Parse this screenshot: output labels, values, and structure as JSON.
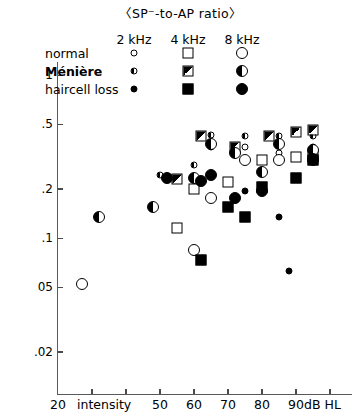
{
  "title": "〈SP⁻-to-AP ratio〉",
  "legend": {
    "position": "top-center-inside",
    "columns": [
      {
        "key": "f2",
        "label": "2 kHz"
      },
      {
        "key": "f4",
        "label": "4 kHz"
      },
      {
        "key": "f8",
        "label": "8 kHz"
      }
    ],
    "rows": [
      {
        "key": "normal",
        "label": "normal",
        "bold": false
      },
      {
        "key": "meniere",
        "label": "Ménière",
        "bold": true
      },
      {
        "key": "haircell",
        "label": "haircell loss",
        "bold": false
      }
    ]
  },
  "axes": {
    "x": {
      "caption": "intensity",
      "unit": "dB HL",
      "min": 20,
      "max": 100,
      "ticks": [
        20,
        30,
        40,
        50,
        60,
        70,
        80,
        90,
        100
      ],
      "tick_labels": [
        "20",
        "",
        "",
        "50",
        "60",
        "70",
        "80",
        "90",
        ""
      ],
      "scale": "linear"
    },
    "y": {
      "label": "",
      "scale": "log",
      "min": 0.018,
      "max": 1.35,
      "ticks": [
        1,
        0.5,
        0.2,
        0.1,
        0.05,
        0.02
      ],
      "tick_labels": [
        "1",
        ".5",
        ".2",
        ".1",
        "05",
        ".02"
      ]
    },
    "grid": false
  },
  "chart_data": {
    "type": "scatter",
    "title": "〈SP⁻-to-AP ratio〉",
    "xlabel": "intensity  (dB HL)",
    "ylabel": "SP⁻-to-AP ratio",
    "xlim": [
      20,
      100
    ],
    "ylim": [
      0.018,
      1.35
    ],
    "yscale": "log",
    "xscale": "linear",
    "grid": false,
    "legend": "inside top-center",
    "series": [
      {
        "name": "normal 2 kHz",
        "group": "normal",
        "frequency": "2 kHz",
        "marker": "circle-small-open",
        "points": [
          {
            "x": 65,
            "y": 0.36
          },
          {
            "x": 75,
            "y": 0.36
          },
          {
            "x": 85,
            "y": 0.33
          },
          {
            "x": 95,
            "y": 0.36
          }
        ]
      },
      {
        "name": "normal 4 kHz",
        "group": "normal",
        "frequency": "4 kHz",
        "marker": "square-open",
        "points": [
          {
            "x": 55,
            "y": 0.115
          },
          {
            "x": 60,
            "y": 0.2
          },
          {
            "x": 70,
            "y": 0.22
          },
          {
            "x": 80,
            "y": 0.3
          },
          {
            "x": 90,
            "y": 0.315
          },
          {
            "x": 95,
            "y": 0.325
          }
        ]
      },
      {
        "name": "normal 8 kHz",
        "group": "normal",
        "frequency": "8 kHz",
        "marker": "circle-large-open",
        "points": [
          {
            "x": 27,
            "y": 0.052
          },
          {
            "x": 60,
            "y": 0.085
          },
          {
            "x": 65,
            "y": 0.175
          },
          {
            "x": 75,
            "y": 0.3
          },
          {
            "x": 85,
            "y": 0.3
          },
          {
            "x": 95,
            "y": 0.3
          }
        ]
      },
      {
        "name": "Ménière 2 kHz",
        "group": "Ménière",
        "frequency": "2 kHz",
        "marker": "circle-small-half",
        "points": [
          {
            "x": 50,
            "y": 0.245
          },
          {
            "x": 60,
            "y": 0.28
          },
          {
            "x": 65,
            "y": 0.43
          },
          {
            "x": 75,
            "y": 0.42
          },
          {
            "x": 85,
            "y": 0.42
          },
          {
            "x": 95,
            "y": 0.42
          }
        ]
      },
      {
        "name": "Ménière 4 kHz",
        "group": "Ménière",
        "frequency": "4 kHz",
        "marker": "square-half",
        "points": [
          {
            "x": 55,
            "y": 0.23
          },
          {
            "x": 62,
            "y": 0.42
          },
          {
            "x": 72,
            "y": 0.36
          },
          {
            "x": 82,
            "y": 0.42
          },
          {
            "x": 90,
            "y": 0.45
          },
          {
            "x": 95,
            "y": 0.46
          }
        ]
      },
      {
        "name": "Ménière 8 kHz",
        "group": "Ménière",
        "frequency": "8 kHz",
        "marker": "circle-large-half",
        "points": [
          {
            "x": 32,
            "y": 0.135
          },
          {
            "x": 48,
            "y": 0.155
          },
          {
            "x": 60,
            "y": 0.235
          },
          {
            "x": 65,
            "y": 0.375
          },
          {
            "x": 72,
            "y": 0.33
          },
          {
            "x": 80,
            "y": 0.255
          },
          {
            "x": 85,
            "y": 0.375
          },
          {
            "x": 95,
            "y": 0.345
          }
        ]
      },
      {
        "name": "haircell loss 2 kHz",
        "group": "haircell loss",
        "frequency": "2 kHz",
        "marker": "circle-small-filled",
        "points": [
          {
            "x": 75,
            "y": 0.195
          },
          {
            "x": 85,
            "y": 0.135
          },
          {
            "x": 88,
            "y": 0.063
          },
          {
            "x": 95,
            "y": 0.3
          }
        ]
      },
      {
        "name": "haircell loss 4 kHz",
        "group": "haircell loss",
        "frequency": "4 kHz",
        "marker": "square-filled",
        "points": [
          {
            "x": 62,
            "y": 0.073
          },
          {
            "x": 70,
            "y": 0.155
          },
          {
            "x": 75,
            "y": 0.135
          },
          {
            "x": 80,
            "y": 0.205
          },
          {
            "x": 90,
            "y": 0.235
          },
          {
            "x": 95,
            "y": 0.3
          }
        ]
      },
      {
        "name": "haircell loss 8 kHz",
        "group": "haircell loss",
        "frequency": "8 kHz",
        "marker": "circle-large-filled",
        "points": [
          {
            "x": 52,
            "y": 0.235
          },
          {
            "x": 62,
            "y": 0.225
          },
          {
            "x": 65,
            "y": 0.245
          },
          {
            "x": 72,
            "y": 0.175
          },
          {
            "x": 80,
            "y": 0.195
          },
          {
            "x": 95,
            "y": 0.305
          }
        ]
      }
    ]
  }
}
